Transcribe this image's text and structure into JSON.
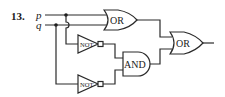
{
  "problem": {
    "number": "13.",
    "inputs": [
      "p",
      "q"
    ]
  },
  "gates": {
    "or_top": "OR",
    "or_final": "OR",
    "and": "AND",
    "not_top": "NOT",
    "not_bottom": "NOT"
  },
  "colors": {
    "line": "#2a2a2a",
    "background": "#ffffff"
  }
}
